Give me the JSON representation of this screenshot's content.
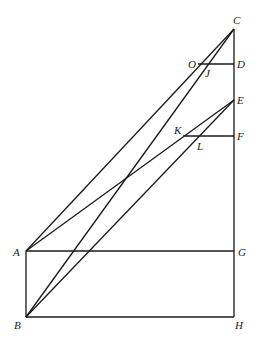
{
  "diagram": {
    "type": "geometric-construction",
    "points": {
      "A": "A",
      "B": "B",
      "C": "C",
      "D": "D",
      "E": "E",
      "F": "F",
      "G": "G",
      "H": "H",
      "J": "J",
      "K": "K",
      "L": "L",
      "O": "O"
    },
    "segments": [
      [
        "A",
        "G"
      ],
      [
        "B",
        "H"
      ],
      [
        "A",
        "B"
      ],
      [
        "C",
        "H"
      ],
      [
        "O",
        "D"
      ],
      [
        "K",
        "F"
      ],
      [
        "A",
        "C"
      ],
      [
        "B",
        "C"
      ],
      [
        "A",
        "E"
      ],
      [
        "B",
        "E"
      ]
    ]
  }
}
